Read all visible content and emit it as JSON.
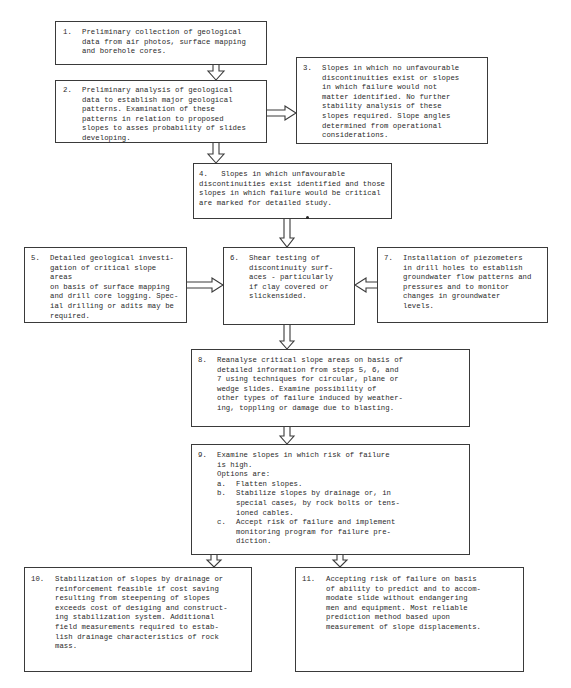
{
  "diagram": {
    "type": "flowchart",
    "colors": {
      "line": "#3a3a3a",
      "text": "#2a2a2a",
      "background": "#ffffff"
    },
    "steps": [
      {
        "id": "1",
        "num": "1.",
        "text": "Preliminary collection of geological\ndata from air photos, surface mapping\nand borehole cores."
      },
      {
        "id": "2",
        "num": "2.",
        "text": "Preliminary analysis of geological\ndata to establish major geological\npatterns.  Examination of these\npatterns in relation to proposed\nslopes to asses probability of slides\ndeveloping."
      },
      {
        "id": "3",
        "num": "3.",
        "text": "Slopes in which no unfavourable\ndiscontinuities exist or slopes\nin which failure would not\nmatter identified.  No further\nstability analysis of these\nslopes required.  Slope angles\ndetermined from operational\nconsiderations."
      },
      {
        "id": "4",
        "num": "4.",
        "text": "Slopes in which unfavourable\ndiscontinuities exist identified and those\nslopes in which failure would be critical\nare marked for detailed study."
      },
      {
        "id": "5",
        "num": "5.",
        "text": "Detailed geological investi-\ngation of critical slope areas\non basis of surface mapping\nand drill core logging.  Spec-\nial drilling or adits may be\nrequired."
      },
      {
        "id": "6",
        "num": "6.",
        "text": "Shear testing of\ndiscontinuity surf-\naces - particularly\nif clay covered or\nslickensided."
      },
      {
        "id": "7",
        "num": "7.",
        "text": "Installation of piezometers\nin drill holes to establish\ngroundwater flow patterns and\npressures and to monitor\nchanges in groundwater\nlevels."
      },
      {
        "id": "8",
        "num": "8.",
        "text": "Reanalyse critical slope areas on basis of\ndetailed information from steps 5, 6, and\n7 using techniques for circular, plane or\nwedge slides.  Examine possibility of\nother types of failure induced by weather-\ning, toppling or damage due to blasting."
      },
      {
        "id": "9",
        "num": "9.",
        "text": "Examine slopes in which risk of failure\nis high.\nOptions are:",
        "options": [
          {
            "label": "a.",
            "text": "Flatten slopes."
          },
          {
            "label": "b.",
            "text": "Stabilize slopes by drainage or, in\nspecial cases, by rock bolts or tens-\nioned cables."
          },
          {
            "label": "c.",
            "text": "Accept risk of failure and implement\nmonitoring program for failure pre-\ndiction."
          }
        ]
      },
      {
        "id": "10",
        "num": "10.",
        "text": "Stabilization of slopes by drainage or\nreinforcement feasible if cost saving\nresulting from steepening of slopes\nexceeds cost of desiging and construct-\ning stabilization system.  Additional\nfield measurements required to estab-\nlish drainage characteristics of rock\nmass."
      },
      {
        "id": "11",
        "num": "11.",
        "text": "Accepting risk of failure on basis\nof ability to predict and to accom-\nmodate slide without endangering\nmen and equipment.  Most reliable\nprediction method based upon\nmeasurement of slope displacements."
      }
    ],
    "connections": [
      {
        "from": "1",
        "to": "2",
        "direction": "down"
      },
      {
        "from": "2",
        "to": "3",
        "direction": "right"
      },
      {
        "from": "2",
        "to": "4",
        "direction": "down"
      },
      {
        "from": "4",
        "to": "6",
        "direction": "down"
      },
      {
        "from": "5",
        "to": "6",
        "direction": "right"
      },
      {
        "from": "7",
        "to": "6",
        "direction": "left"
      },
      {
        "from": "6",
        "to": "8",
        "direction": "down"
      },
      {
        "from": "8",
        "to": "9",
        "direction": "down"
      },
      {
        "from": "9",
        "to": "10",
        "direction": "down"
      },
      {
        "from": "9",
        "to": "11",
        "direction": "down"
      }
    ]
  }
}
